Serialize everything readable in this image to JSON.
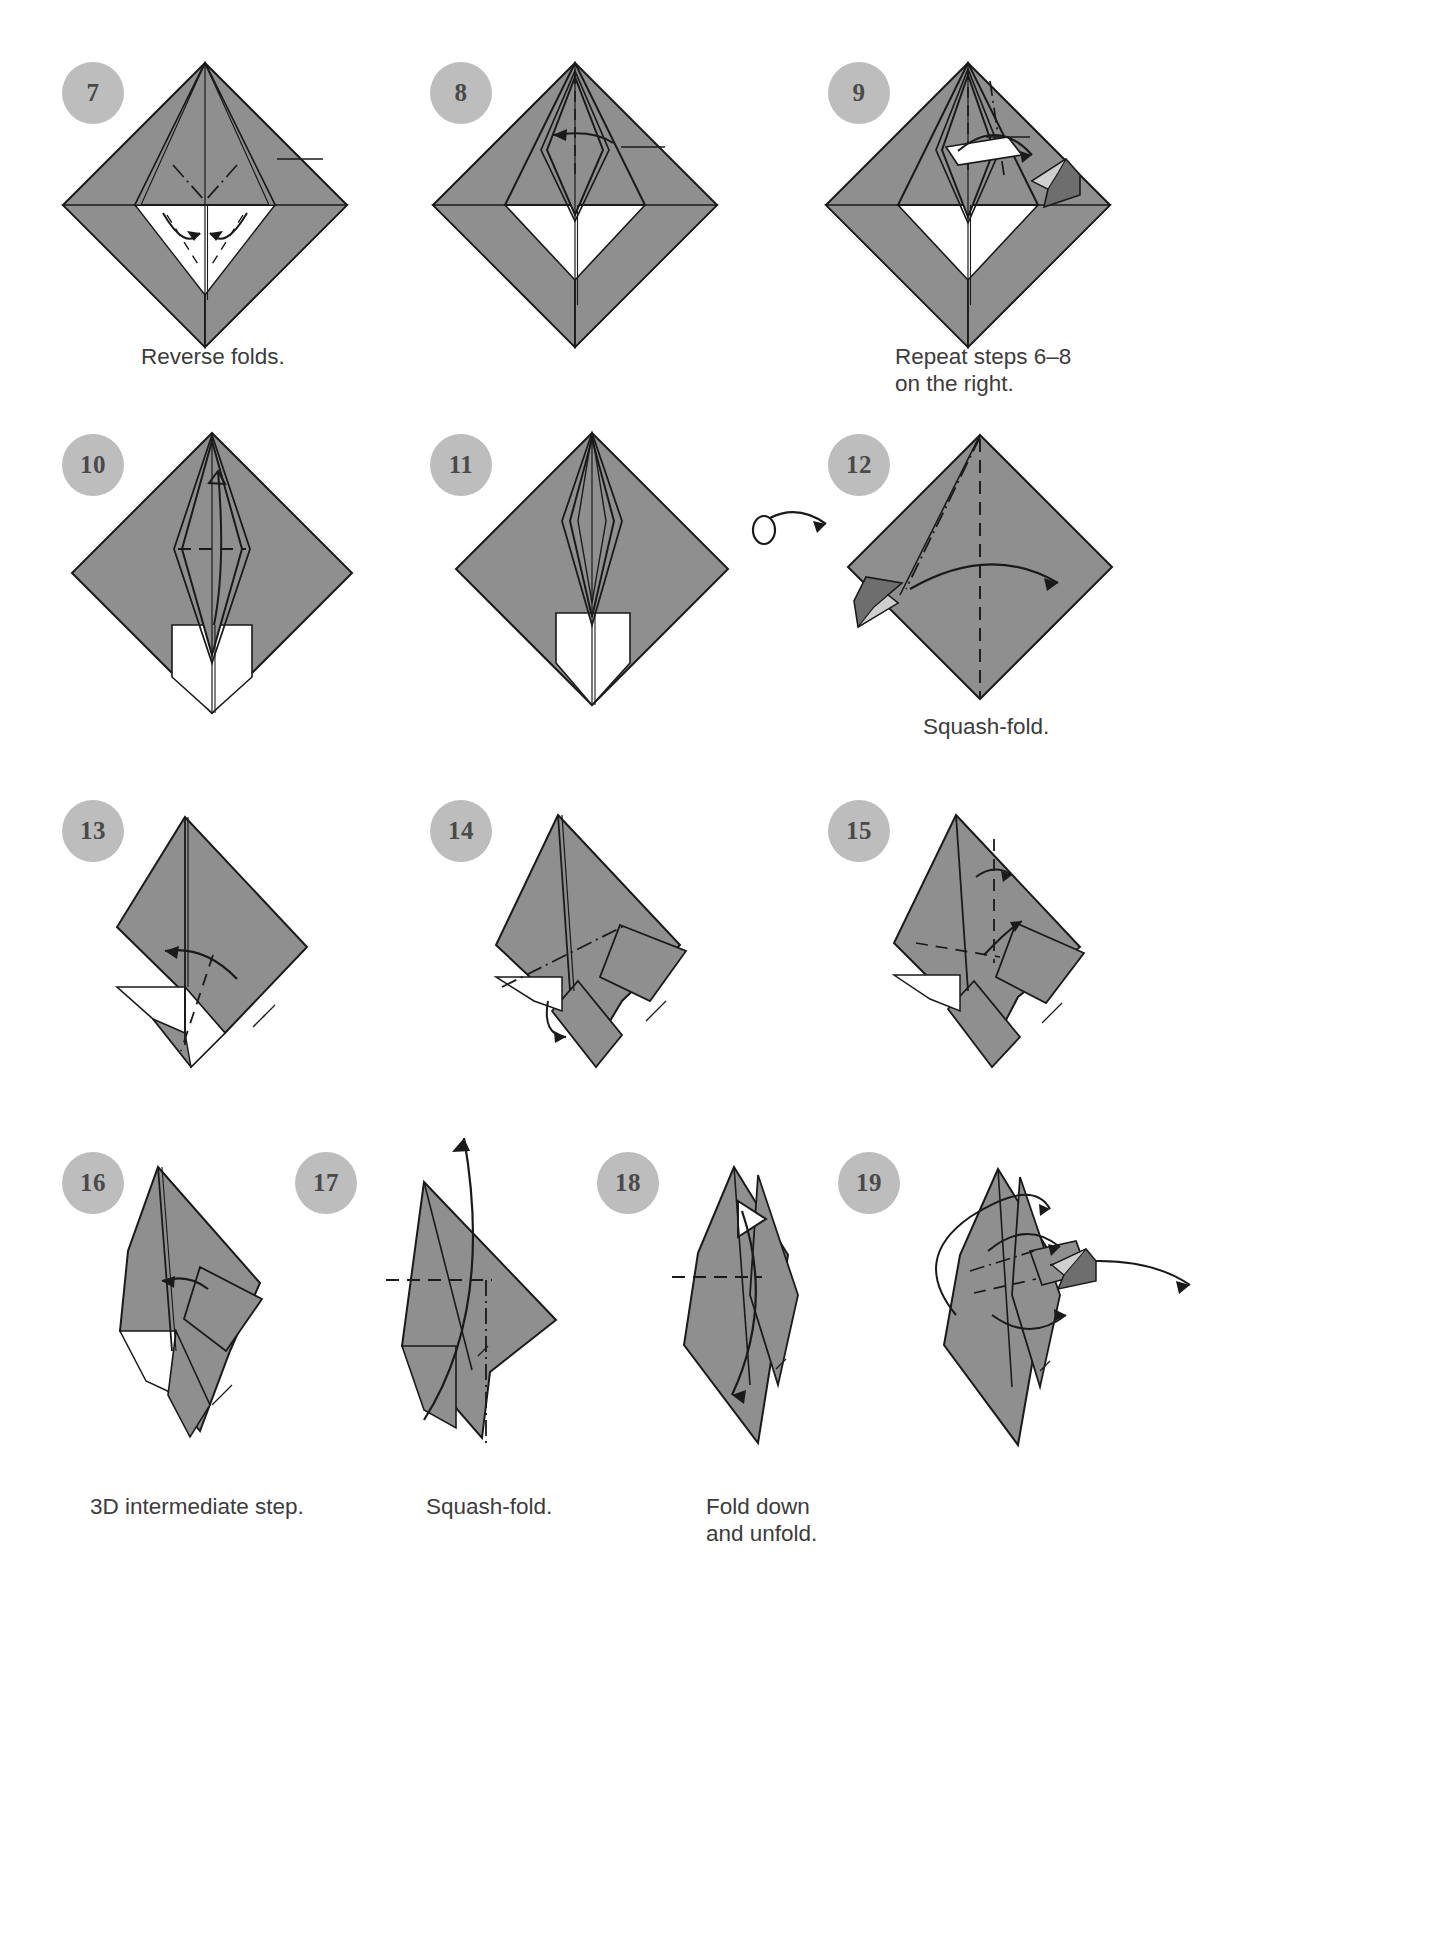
{
  "page": {
    "kind": "origami-instruction-diagram",
    "width": 1442,
    "height": 1954,
    "background": "#ffffff",
    "paper_front_color": "#8f8f8f",
    "paper_back_color": "#ffffff",
    "line_color": "#1a1a1a",
    "badge_color": "#bdbdbd",
    "badge_text_color": "#4a4a4a",
    "caption_color": "#3c3c3c"
  },
  "steps": [
    {
      "number": "7",
      "badge_x": 62,
      "badge_y": 62,
      "caption": "Reverse folds.",
      "caption_x": 141,
      "caption_y": 343,
      "shape": "diamond-front",
      "fig_x": 55,
      "fig_y": 55,
      "fig_w": 330,
      "fig_h": 280
    },
    {
      "number": "8",
      "badge_x": 430,
      "badge_y": 62,
      "caption": "",
      "caption_x": 0,
      "caption_y": 0,
      "shape": "diamond-front",
      "fig_x": 425,
      "fig_y": 55,
      "fig_w": 330,
      "fig_h": 280
    },
    {
      "number": "9",
      "badge_x": 828,
      "badge_y": 62,
      "caption": "Repeat steps 6–8\non the right.",
      "caption_x": 895,
      "caption_y": 343,
      "shape": "diamond-front-arrow",
      "fig_x": 818,
      "fig_y": 55,
      "fig_w": 330,
      "fig_h": 280
    },
    {
      "number": "10",
      "badge_x": 62,
      "badge_y": 434,
      "caption": "",
      "caption_x": 0,
      "caption_y": 0,
      "shape": "diamond-kite",
      "fig_x": 60,
      "fig_y": 425,
      "fig_w": 300,
      "fig_h": 290
    },
    {
      "number": "11",
      "badge_x": 430,
      "badge_y": 434,
      "caption": "",
      "caption_x": 0,
      "caption_y": 0,
      "shape": "diamond-kite-narrow",
      "fig_x": 440,
      "fig_y": 425,
      "fig_w": 300,
      "fig_h": 270
    },
    {
      "number": "12",
      "badge_x": 828,
      "badge_y": 434,
      "caption": "Squash-fold.",
      "caption_x": 923,
      "caption_y": 713,
      "shape": "plain-diamond-squash",
      "fig_x": 840,
      "fig_y": 425,
      "fig_w": 270,
      "fig_h": 270
    },
    {
      "number": "13",
      "badge_x": 62,
      "badge_y": 800,
      "caption": "",
      "caption_x": 0,
      "caption_y": 0,
      "shape": "tilted-a",
      "fig_x": 95,
      "fig_y": 805,
      "fig_w": 270,
      "fig_h": 270
    },
    {
      "number": "14",
      "badge_x": 430,
      "badge_y": 800,
      "caption": "",
      "caption_x": 0,
      "caption_y": 0,
      "shape": "tilted-b",
      "fig_x": 470,
      "fig_y": 805,
      "fig_w": 270,
      "fig_h": 270
    },
    {
      "number": "15",
      "badge_x": 828,
      "badge_y": 800,
      "caption": "",
      "caption_x": 0,
      "caption_y": 0,
      "shape": "tilted-c",
      "fig_x": 870,
      "fig_y": 805,
      "fig_w": 270,
      "fig_h": 270
    },
    {
      "number": "16",
      "badge_x": 62,
      "badge_y": 1152,
      "caption": "3D intermediate step.",
      "caption_x": 90,
      "caption_y": 1493,
      "shape": "narrow-a",
      "fig_x": 80,
      "fig_y": 1155,
      "fig_w": 220,
      "fig_h": 290
    },
    {
      "number": "17",
      "badge_x": 295,
      "badge_y": 1152,
      "caption": "Squash-fold.",
      "caption_x": 426,
      "caption_y": 1493,
      "shape": "narrow-b",
      "fig_x": 360,
      "fig_y": 1120,
      "fig_w": 220,
      "fig_h": 330
    },
    {
      "number": "18",
      "badge_x": 597,
      "badge_y": 1152,
      "caption": "Fold down\nand unfold.",
      "caption_x": 706,
      "caption_y": 1493,
      "shape": "narrow-c",
      "fig_x": 650,
      "fig_y": 1155,
      "fig_w": 220,
      "fig_h": 300
    },
    {
      "number": "19",
      "badge_x": 838,
      "badge_y": 1152,
      "caption": "",
      "caption_x": 0,
      "caption_y": 0,
      "shape": "narrow-d",
      "fig_x": 900,
      "fig_y": 1155,
      "fig_w": 300,
      "fig_h": 300
    }
  ],
  "symbols": {
    "turn_over": {
      "name": "turn-over-arrow",
      "x": 742,
      "y": 500,
      "label": "turn over"
    }
  }
}
